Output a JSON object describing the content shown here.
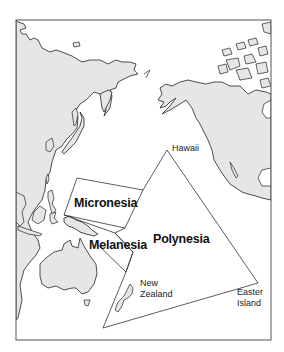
{
  "map": {
    "title": "Pacific Ocean cultural regions",
    "frame": {
      "x": 16,
      "y": 20,
      "width": 255,
      "height": 320,
      "border_color": "#555555"
    },
    "colors": {
      "land_fill": "#e6e6e6",
      "coast_stroke": "#222222",
      "region_stroke": "#333333",
      "background": "#ffffff"
    },
    "regions": [
      {
        "name": "Micronesia",
        "label": "Micronesia"
      },
      {
        "name": "Melanesia",
        "label": "Melanesia"
      },
      {
        "name": "Polynesia",
        "label": "Polynesia"
      }
    ],
    "places": [
      {
        "name": "Hawaii",
        "label": "Hawaii"
      },
      {
        "name": "New Zealand",
        "label_line1": "New",
        "label_line2": "Zealand"
      },
      {
        "name": "Easter Island",
        "label_line1": "Easter",
        "label_line2": "Island"
      }
    ]
  }
}
